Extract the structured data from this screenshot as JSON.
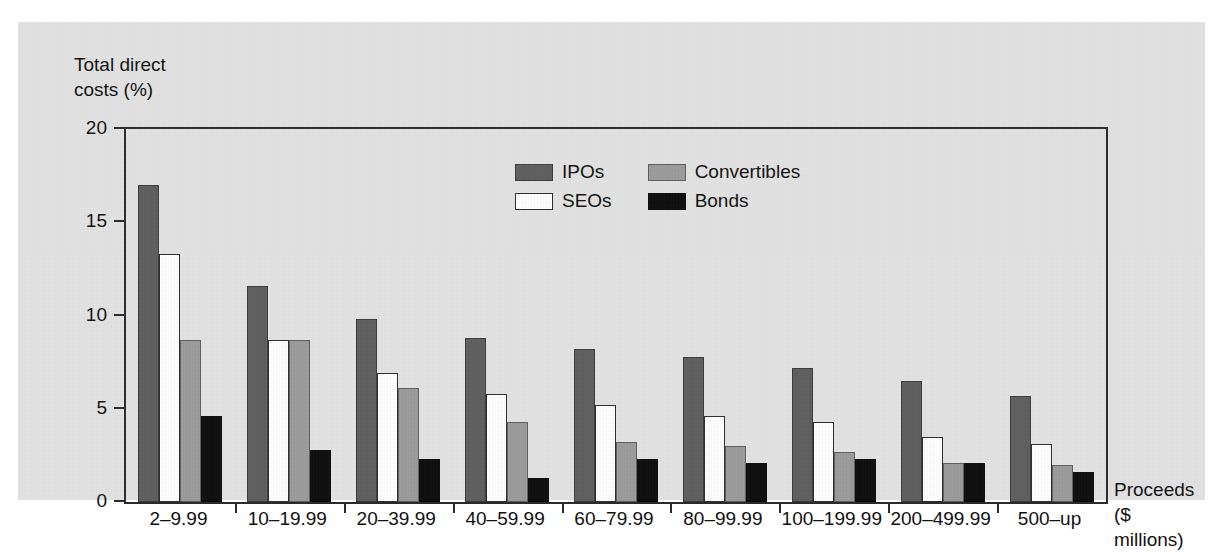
{
  "chart_data": {
    "type": "bar",
    "title": "",
    "ylabel": "Total direct\ncosts (%)",
    "xlabel": "Proceeds\n($ millions)",
    "ylim": [
      0,
      20
    ],
    "yticks": [
      0,
      5,
      10,
      15,
      20
    ],
    "grid": false,
    "legend_position": "upper-center-inside",
    "categories": [
      "2–9.99",
      "10–19.99",
      "20–39.99",
      "40–59.99",
      "60–79.99",
      "80–99.99",
      "100–199.99",
      "200–499.99",
      "500–up"
    ],
    "series": [
      {
        "name": "IPOs",
        "color": "#5e5e5e",
        "values": [
          17.0,
          11.6,
          9.8,
          8.8,
          8.2,
          7.8,
          7.2,
          6.5,
          5.7
        ]
      },
      {
        "name": "SEOs",
        "color": "#ffffff",
        "values": [
          13.3,
          8.7,
          6.9,
          5.8,
          5.2,
          4.6,
          4.3,
          3.5,
          3.1
        ]
      },
      {
        "name": "Convertibles",
        "color": "#9a9a9a",
        "values": [
          8.7,
          8.7,
          6.1,
          4.3,
          3.2,
          3.0,
          2.7,
          2.1,
          2.0
        ]
      },
      {
        "name": "Bonds",
        "color": "#0d0d0d",
        "values": [
          4.6,
          2.8,
          2.3,
          1.3,
          2.3,
          2.1,
          2.3,
          2.1,
          1.6
        ]
      }
    ]
  },
  "axes": {
    "y_title": "Total direct\ncosts (%)",
    "x_title": "Proceeds\n($ millions)",
    "y_tick_labels": [
      "20",
      "15",
      "10",
      "5",
      "0"
    ]
  },
  "legend": {
    "items": [
      {
        "label": "IPOs",
        "swatch": "ipos"
      },
      {
        "label": "Convertibles",
        "swatch": "convertibles"
      },
      {
        "label": "SEOs",
        "swatch": "seos"
      },
      {
        "label": "Bonds",
        "swatch": "bonds"
      }
    ]
  },
  "colors": {
    "panel_background": "#e2e2e2",
    "axis": "#2b2b2b",
    "ipos": "#5e5e5e",
    "seos": "#ffffff",
    "convertibles": "#9a9a9a",
    "bonds": "#0d0d0d"
  }
}
